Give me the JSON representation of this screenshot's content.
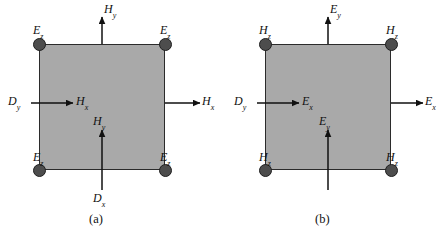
{
  "figure": {
    "panels": [
      {
        "id": "a",
        "caption": "(a)",
        "corner_nodes": [
          {
            "position": "top-left",
            "symbol": "E",
            "sub": "z"
          },
          {
            "position": "top-right",
            "symbol": "E",
            "sub": "z"
          },
          {
            "position": "bottom-left",
            "symbol": "E",
            "sub": "z"
          },
          {
            "position": "bottom-right",
            "symbol": "E",
            "sub": "z"
          }
        ],
        "arrows": [
          {
            "id": "top-outer",
            "direction": "up",
            "symbol": "H",
            "sub": "y"
          },
          {
            "id": "left-incoming",
            "direction": "right",
            "symbol": "D",
            "sub": "y"
          },
          {
            "id": "interior-x",
            "direction": "right",
            "symbol": "H",
            "sub": "x"
          },
          {
            "id": "right-outer",
            "direction": "right",
            "symbol": "H",
            "sub": "x"
          },
          {
            "id": "interior-y",
            "direction": "up",
            "symbol": "H",
            "sub": "y"
          },
          {
            "id": "bottom-incoming",
            "direction": "up",
            "symbol": "D",
            "sub": "x"
          }
        ]
      },
      {
        "id": "b",
        "caption": "(b)",
        "corner_nodes": [
          {
            "position": "top-left",
            "symbol": "H",
            "sub": "z"
          },
          {
            "position": "top-right",
            "symbol": "H",
            "sub": "z"
          },
          {
            "position": "bottom-left",
            "symbol": "H",
            "sub": "z"
          },
          {
            "position": "bottom-right",
            "symbol": "H",
            "sub": "z"
          }
        ],
        "arrows": [
          {
            "id": "top-outer",
            "direction": "up",
            "symbol": "E",
            "sub": "y"
          },
          {
            "id": "left-incoming",
            "direction": "right",
            "symbol": "D",
            "sub": "y"
          },
          {
            "id": "interior-x",
            "direction": "right",
            "symbol": "E",
            "sub": "x"
          },
          {
            "id": "right-outer",
            "direction": "right",
            "symbol": "E",
            "sub": "x"
          },
          {
            "id": "interior-y",
            "direction": "up",
            "symbol": "E",
            "sub": "y"
          },
          {
            "id": "bottom-incoming",
            "direction": "up",
            "symbol": "D",
            "sub": "x"
          }
        ]
      }
    ],
    "labels": {
      "a": {
        "corner_tl": "E",
        "corner_tl_sub": "z",
        "corner_tr": "E",
        "corner_tr_sub": "z",
        "corner_bl": "E",
        "corner_bl_sub": "z",
        "corner_br": "E",
        "corner_br_sub": "z",
        "top": "H",
        "top_sub": "y",
        "left": "D",
        "left_sub": "y",
        "interior_x": "H",
        "interior_x_sub": "x",
        "right": "H",
        "right_sub": "x",
        "interior_y": "H",
        "interior_y_sub": "y",
        "bottom": "D",
        "bottom_sub": "x",
        "caption": "(a)"
      },
      "b": {
        "corner_tl": "H",
        "corner_tl_sub": "z",
        "corner_tr": "H",
        "corner_tr_sub": "z",
        "corner_bl": "H",
        "corner_bl_sub": "z",
        "corner_br": "H",
        "corner_br_sub": "z",
        "top": "E",
        "top_sub": "y",
        "left": "D",
        "left_sub": "y",
        "interior_x": "E",
        "interior_x_sub": "x",
        "right": "E",
        "right_sub": "x",
        "interior_y": "E",
        "interior_y_sub": "y",
        "bottom": "D",
        "bottom_sub": "x",
        "caption": "(b)"
      }
    },
    "colors": {
      "cell_fill": "#a9a9a9",
      "cell_border": "#2b2b2b",
      "node_fill": "#4d4d4d",
      "node_border": "#1f1f1f",
      "arrow": "#111111",
      "text": "#111111",
      "background": "#ffffff"
    }
  }
}
